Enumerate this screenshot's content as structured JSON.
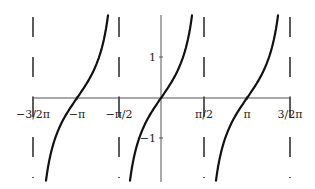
{
  "chart_data": {
    "type": "line",
    "title": "",
    "xlabel": "",
    "ylabel": "",
    "function": "tan(x)",
    "x_tick_labels": [
      "−3/2π",
      "−π",
      "−π/2",
      "π/2",
      "π",
      "3/2π"
    ],
    "x_tick_values": [
      -4.712,
      -3.1416,
      -1.5708,
      1.5708,
      3.1416,
      4.712
    ],
    "y_tick_labels": [
      "1",
      "−1"
    ],
    "y_tick_values": [
      1,
      -1
    ],
    "xlim": [
      -4.712,
      4.712
    ],
    "ylim": [
      -2.1,
      2.1
    ],
    "grid": false,
    "legend": null,
    "asymptotes": {
      "style": "dashed",
      "x": [
        -4.712,
        -1.5708,
        1.5708,
        4.712
      ],
      "labels": [
        "x = −3π/2",
        "x = −π/2",
        "x = π/2",
        "x = 3π/2"
      ]
    },
    "series": [
      {
        "name": "tan branch centered at −π",
        "center": -3.1416,
        "x": [
          -4.26,
          -3.93,
          -3.54,
          -3.1416,
          -2.74,
          -2.36,
          -2.02
        ],
        "y": [
          -2.1,
          -1.0,
          -0.42,
          0,
          0.42,
          1.0,
          2.1
        ]
      },
      {
        "name": "tan branch centered at 0",
        "center": 0,
        "x": [
          -1.12,
          -0.79,
          -0.4,
          0,
          0.4,
          0.79,
          1.12
        ],
        "y": [
          -2.1,
          -1.0,
          -0.42,
          0,
          0.42,
          1.0,
          2.1
        ]
      },
      {
        "name": "tan branch centered at π",
        "center": 3.1416,
        "x": [
          2.02,
          2.36,
          2.74,
          3.1416,
          3.54,
          3.93,
          4.26
        ],
        "y": [
          -2.1,
          -1.0,
          -0.42,
          0,
          0.42,
          1.0,
          2.1
        ]
      }
    ],
    "colors": {
      "curve": "#111111",
      "axis": "#555555",
      "asymptote": "#333333"
    }
  },
  "layout": {
    "origin_px": [
      161,
      98
    ],
    "axis_x_range_px": [
      33,
      290
    ],
    "axis_y_range_px": [
      15,
      182
    ],
    "branch_centers_px": [
      77,
      161,
      247
    ],
    "asymptote_px": [
      33,
      119,
      204,
      290
    ],
    "tick_x_px": [
      33,
      77,
      119,
      204,
      247,
      290
    ],
    "tick_y_px": [
      57,
      138
    ]
  }
}
